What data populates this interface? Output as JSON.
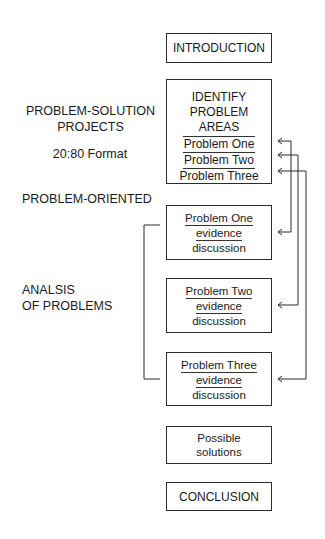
{
  "left_labels": {
    "problem_solution": [
      "PROBLEM-SOLUTION",
      "PROJECTS"
    ],
    "format": "20:80 Format",
    "problem_oriented": "PROBLEM-ORIENTED",
    "analysis": [
      "ANALSIS",
      "OF PROBLEMS"
    ]
  },
  "boxes": {
    "introduction": "INTRODUCTION",
    "identify": {
      "heading": [
        "IDENTIFY",
        "PROBLEM",
        "AREAS"
      ],
      "items": [
        "Problem One",
        "Problem Two",
        "Problem Three"
      ]
    },
    "problem_one": [
      "Problem One",
      "evidence",
      "discussion"
    ],
    "problem_two": [
      "Problem Two",
      "evidence",
      "discussion"
    ],
    "problem_three": [
      "Problem Three",
      "evidence",
      "discussion"
    ],
    "solutions": [
      "Possible",
      "solutions"
    ],
    "conclusion": "CONCLUSION"
  },
  "colors": {
    "line": "#2a2a2a",
    "text": "#1a1a1a",
    "background": "#ffffff"
  }
}
